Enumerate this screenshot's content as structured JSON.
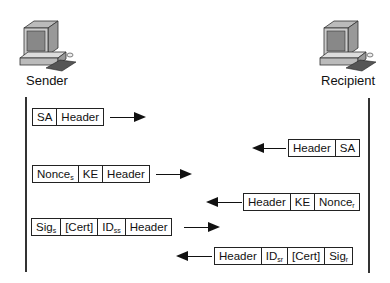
{
  "participants": {
    "sender": {
      "label": "Sender",
      "icon": "computer-icon"
    },
    "recipient": {
      "label": "Recipient",
      "icon": "computer-icon"
    }
  },
  "messages": [
    {
      "direction": "right",
      "fields": [
        {
          "text": "SA",
          "sub": ""
        },
        {
          "text": "Header",
          "sub": ""
        }
      ]
    },
    {
      "direction": "left",
      "fields": [
        {
          "text": "Header",
          "sub": ""
        },
        {
          "text": "SA",
          "sub": ""
        }
      ]
    },
    {
      "direction": "right",
      "fields": [
        {
          "text": "Nonce",
          "sub": "s"
        },
        {
          "text": "KE",
          "sub": ""
        },
        {
          "text": "Header",
          "sub": ""
        }
      ]
    },
    {
      "direction": "left",
      "fields": [
        {
          "text": "Header",
          "sub": ""
        },
        {
          "text": "KE",
          "sub": ""
        },
        {
          "text": "Nonce",
          "sub": "r"
        }
      ]
    },
    {
      "direction": "right",
      "fields": [
        {
          "text": "Sig",
          "sub": "s"
        },
        {
          "text": "[Cert]",
          "sub": ""
        },
        {
          "text": "ID",
          "sub": "ss"
        },
        {
          "text": "Header",
          "sub": ""
        }
      ]
    },
    {
      "direction": "left",
      "fields": [
        {
          "text": "Header",
          "sub": ""
        },
        {
          "text": "ID",
          "sub": "sr"
        },
        {
          "text": "[Cert]",
          "sub": ""
        },
        {
          "text": "Sig",
          "sub": "r"
        }
      ]
    }
  ]
}
